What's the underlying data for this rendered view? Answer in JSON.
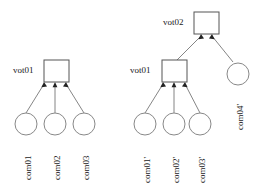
{
  "diagram": {
    "background_color": "#ffffff",
    "box_stroke_color": "#555555",
    "circle_stroke_color": "#888888",
    "edge_color": "#777777",
    "arrow_color": "#222222",
    "left_tree": {
      "root": {
        "label": "vot01",
        "shape": "square"
      },
      "children": [
        {
          "label": "com01",
          "shape": "circle"
        },
        {
          "label": "com02",
          "shape": "circle"
        },
        {
          "label": "com03",
          "shape": "circle"
        }
      ]
    },
    "right_tree": {
      "root": {
        "label": "vot02",
        "shape": "square"
      },
      "children": [
        {
          "label": "vot01",
          "shape": "square"
        },
        {
          "label": "com04'",
          "shape": "circle"
        }
      ],
      "grandchildren": [
        {
          "label": "com01'",
          "shape": "circle"
        },
        {
          "label": "com02'",
          "shape": "circle"
        },
        {
          "label": "com03'",
          "shape": "circle"
        }
      ]
    }
  }
}
